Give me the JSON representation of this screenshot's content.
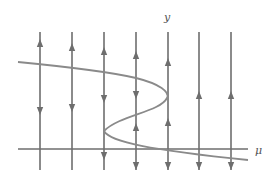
{
  "figure": {
    "type": "bifurcation-diagram",
    "colors": {
      "line": "#6e6e6e",
      "curve": "#8a8a8a",
      "background": "#ffffff"
    }
  },
  "axes": {
    "x_label": "μ",
    "y_label": "y"
  },
  "flow_lines": [
    {
      "x": 40,
      "arrows": [
        {
          "y": 44,
          "dir": "up"
        },
        {
          "y": 110,
          "dir": "down"
        }
      ]
    },
    {
      "x": 72,
      "arrows": [
        {
          "y": 48,
          "dir": "up"
        },
        {
          "y": 107,
          "dir": "down"
        }
      ]
    },
    {
      "x": 104,
      "arrows": [
        {
          "y": 52,
          "dir": "up"
        },
        {
          "y": 98,
          "dir": "down"
        },
        {
          "y": 155,
          "dir": "down"
        }
      ]
    },
    {
      "x": 136,
      "arrows": [
        {
          "y": 56,
          "dir": "up"
        },
        {
          "y": 94,
          "dir": "down"
        },
        {
          "y": 128,
          "dir": "up"
        },
        {
          "y": 165,
          "dir": "down"
        }
      ]
    },
    {
      "x": 168,
      "arrows": [
        {
          "y": 63,
          "dir": "up"
        },
        {
          "y": 123,
          "dir": "up"
        },
        {
          "y": 165,
          "dir": "down"
        }
      ]
    },
    {
      "x": 199,
      "arrows": [
        {
          "y": 96,
          "dir": "up"
        },
        {
          "y": 165,
          "dir": "down"
        }
      ]
    },
    {
      "x": 231,
      "arrows": [
        {
          "y": 96,
          "dir": "up"
        },
        {
          "y": 165,
          "dir": "down"
        }
      ]
    }
  ],
  "mu_axis": {
    "y": 149,
    "x_start": 18,
    "x_end": 248
  },
  "equilibrium_curve": {
    "path": "M18,62 C60,66 110,72 136,78 C160,84 170,92 167,98 C160,112 120,115 104,131 C110,142 150,150 248,160"
  }
}
